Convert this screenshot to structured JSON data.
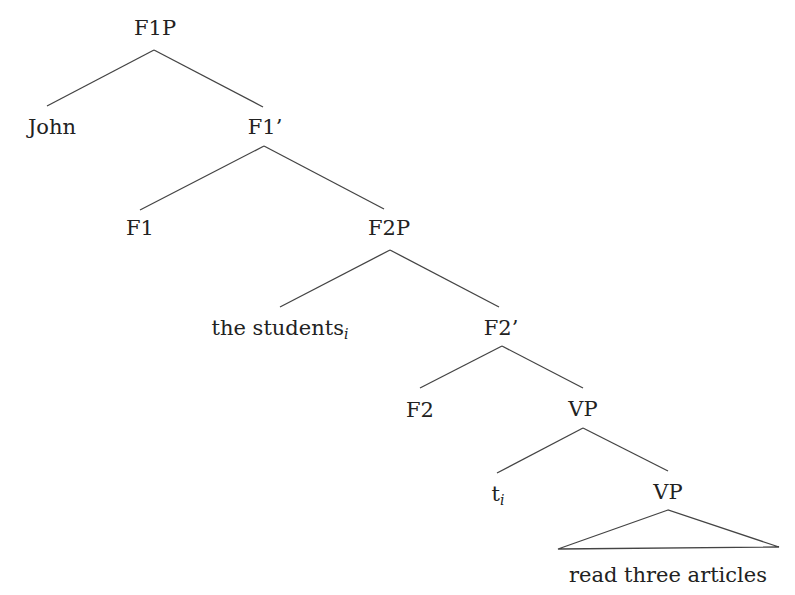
{
  "tree": {
    "nodes": {
      "f1p": {
        "label": "F1P"
      },
      "john": {
        "label": "John"
      },
      "f1bar": {
        "label": "F1’"
      },
      "f1": {
        "label": "F1"
      },
      "f2p": {
        "label": "F2P"
      },
      "students": {
        "label": "the students",
        "index": "i"
      },
      "f2bar": {
        "label": "F2’"
      },
      "f2": {
        "label": "F2"
      },
      "vp1": {
        "label": "VP"
      },
      "trace": {
        "label": "t",
        "index": "i"
      },
      "vp2": {
        "label": "VP"
      },
      "leaf": {
        "label": "read three articles"
      }
    }
  },
  "colors": {
    "line": "#444444",
    "text": "#222222"
  }
}
